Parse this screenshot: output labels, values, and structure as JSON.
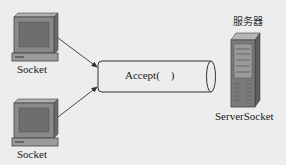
{
  "diagram": {
    "title": "服务器",
    "clients": [
      {
        "label": "Socket",
        "icon": "computer-icon"
      },
      {
        "label": "Socket",
        "icon": "computer-icon"
      }
    ],
    "pipe": {
      "label": "Accept(    )",
      "shape": "cylinder"
    },
    "server": {
      "label": "ServerSocket",
      "heading": "服务器",
      "icon": "server-tower-icon"
    },
    "edges": [
      {
        "from": "client-1",
        "to": "pipe",
        "type": "arrow"
      },
      {
        "from": "client-2",
        "to": "pipe",
        "type": "arrow"
      }
    ],
    "colors": {
      "background": "#ededed",
      "stroke": "#3a3a3a",
      "monitor_body": "#8a8a8a",
      "screen": "#6e6e6e",
      "server_body": "#7a7a7a"
    }
  }
}
